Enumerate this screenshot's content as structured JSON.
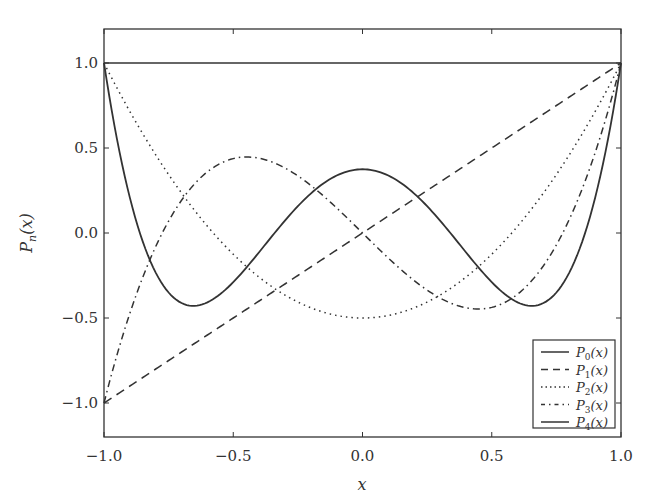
{
  "chart_data": {
    "type": "line",
    "title": "",
    "xlabel": "x",
    "ylabel": "P_n(x)",
    "xlim": [
      -1.0,
      1.0
    ],
    "ylim": [
      -1.2,
      1.2
    ],
    "grid": false,
    "legend_position": "lower right",
    "xticks": [
      -1.0,
      -0.5,
      0.0,
      0.5,
      1.0
    ],
    "xtick_labels": [
      "−1.0",
      "−0.5",
      "0.0",
      "0.5",
      "1.0"
    ],
    "yticks": [
      -1.0,
      -0.5,
      0.0,
      0.5,
      1.0
    ],
    "ytick_labels": [
      "−1.0",
      "−0.5",
      "0.0",
      "0.5",
      "1.0"
    ],
    "x": [
      -1.0,
      -0.9,
      -0.8,
      -0.7,
      -0.6,
      -0.5,
      -0.4,
      -0.3,
      -0.2,
      -0.1,
      0.0,
      0.1,
      0.2,
      0.3,
      0.4,
      0.5,
      0.6,
      0.7,
      0.8,
      0.9,
      1.0
    ],
    "series": [
      {
        "name": "P_0(x)",
        "style": "solid",
        "values": [
          1,
          1,
          1,
          1,
          1,
          1,
          1,
          1,
          1,
          1,
          1,
          1,
          1,
          1,
          1,
          1,
          1,
          1,
          1,
          1,
          1
        ]
      },
      {
        "name": "P_1(x)",
        "style": "dashed",
        "values": [
          -1.0,
          -0.9,
          -0.8,
          -0.7,
          -0.6,
          -0.5,
          -0.4,
          -0.3,
          -0.2,
          -0.1,
          0.0,
          0.1,
          0.2,
          0.3,
          0.4,
          0.5,
          0.6,
          0.7,
          0.8,
          0.9,
          1.0
        ]
      },
      {
        "name": "P_2(x)",
        "style": "dotted",
        "values": [
          1.0,
          0.715,
          0.46,
          0.235,
          0.04,
          -0.125,
          -0.26,
          -0.365,
          -0.44,
          -0.485,
          -0.5,
          -0.485,
          -0.44,
          -0.365,
          -0.26,
          -0.125,
          0.04,
          0.235,
          0.46,
          0.715,
          1.0
        ]
      },
      {
        "name": "P_3(x)",
        "style": "dashdot",
        "values": [
          -1.0,
          -0.4725,
          -0.08,
          0.1925,
          0.36,
          0.4375,
          0.44,
          0.3825,
          0.28,
          0.1475,
          0.0,
          -0.1475,
          -0.28,
          -0.3825,
          -0.44,
          -0.4375,
          -0.36,
          -0.1925,
          0.08,
          0.4725,
          1.0
        ]
      },
      {
        "name": "P_4(x)",
        "style": "solid",
        "values": [
          1.0,
          0.2079,
          -0.233,
          -0.4121,
          -0.408,
          -0.2891,
          -0.113,
          0.0729,
          0.232,
          0.3379,
          0.375,
          0.3379,
          0.232,
          0.0729,
          -0.113,
          -0.2891,
          -0.408,
          -0.4121,
          -0.233,
          0.2079,
          1.0
        ]
      }
    ]
  },
  "legend": {
    "items": [
      {
        "base": "P",
        "sub": "0",
        "suffix": "(x)"
      },
      {
        "base": "P",
        "sub": "1",
        "suffix": "(x)"
      },
      {
        "base": "P",
        "sub": "2",
        "suffix": "(x)"
      },
      {
        "base": "P",
        "sub": "3",
        "suffix": "(x)"
      },
      {
        "base": "P",
        "sub": "4",
        "suffix": "(x)"
      }
    ]
  },
  "axes": {
    "xlabel": "x",
    "ylabel_base": "P",
    "ylabel_sub": "n",
    "ylabel_suffix": "(x)"
  },
  "colors": {
    "line": "#333333",
    "axes": "#333333",
    "background": "#ffffff"
  }
}
